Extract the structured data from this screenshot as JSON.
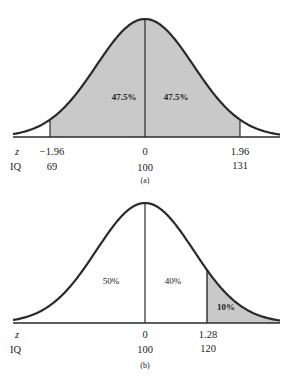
{
  "chart_data": [
    {
      "type": "area",
      "panel": "(a)",
      "title": "",
      "description": "Normal distribution of IQ; shaded area between z=-1.96 and z=1.96",
      "row_labels": {
        "z": "z",
        "iq": "IQ"
      },
      "ticks": [
        {
          "z": "−1.96",
          "iq": "69"
        },
        {
          "z": "0",
          "iq": "100"
        },
        {
          "z": "1.96",
          "iq": "131"
        }
      ],
      "shaded_regions": [
        {
          "from_z": -1.96,
          "to_z": 0,
          "label": "47.5%"
        },
        {
          "from_z": 0,
          "to_z": 1.96,
          "label": "47.5%"
        }
      ],
      "mean": 100,
      "sd": 15.8,
      "caption": "(a)"
    },
    {
      "type": "area",
      "panel": "(b)",
      "title": "",
      "description": "Normal distribution of IQ; shaded upper tail above z=1.28",
      "row_labels": {
        "z": "z",
        "iq": "IQ"
      },
      "ticks": [
        {
          "z": "0",
          "iq": "100"
        },
        {
          "z": "1.28",
          "iq": "120"
        }
      ],
      "regions": [
        {
          "from_z": null,
          "to_z": 0,
          "label": "50%",
          "shaded": false
        },
        {
          "from_z": 0,
          "to_z": 1.28,
          "label": "40%",
          "shaded": false
        },
        {
          "from_z": 1.28,
          "to_z": null,
          "label": "10%",
          "shaded": true
        }
      ],
      "mean": 100,
      "caption": "(b)"
    }
  ],
  "panel_a": {
    "left_pct": "47.5%",
    "right_pct": "47.5%",
    "z_label": "z",
    "iq_label": "IQ",
    "z_ticks": [
      "−1.96",
      "0",
      "1.96"
    ],
    "iq_ticks": [
      "69",
      "100",
      "131"
    ],
    "caption": "(a)"
  },
  "panel_b": {
    "left_pct": "50%",
    "mid_pct": "40%",
    "tail_pct": "10%",
    "z_label": "z",
    "iq_label": "IQ",
    "z_ticks": [
      "0",
      "1.28"
    ],
    "iq_ticks": [
      "100",
      "120"
    ],
    "caption": "(b)"
  },
  "colors": {
    "shade": "#c9c9c9",
    "curve": "#2a2a2a"
  }
}
